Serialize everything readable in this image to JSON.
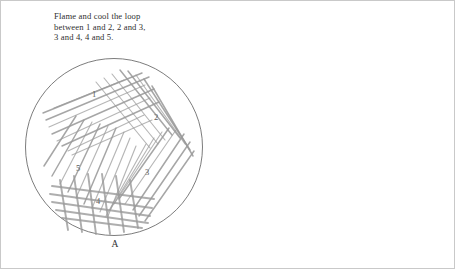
{
  "figure": {
    "background_color": "#ffffff",
    "frame_color": "#c9c9c9",
    "streak_color": "#9a9a9a",
    "rim_color": "#6d6d6d",
    "text_color": "#2f2f2f"
  },
  "panels": [
    {
      "id": "A",
      "label": "A",
      "caption": "Flame and cool the loop\nbetween 1 and 2, 2 and 3,\n3 and 4, 4 and 5.",
      "caption_lines": [
        "Flame and cool the loop",
        "between 1 and 2, 2 and 3,",
        "3 and 4, 4 and 5."
      ],
      "technique": "quadrant-streak",
      "sector_count": 5,
      "sector_labels": [
        "1",
        "2",
        "3",
        "4",
        "5"
      ],
      "sector_positions": [
        {
          "label": "1",
          "x": 68,
          "y": 39
        },
        {
          "label": "2",
          "x": 130,
          "y": 62
        },
        {
          "label": "3",
          "x": 121,
          "y": 117
        },
        {
          "label": "4",
          "x": 72,
          "y": 146
        },
        {
          "label": "5",
          "x": 52,
          "y": 113
        }
      ]
    },
    {
      "id": "B",
      "label": "B",
      "caption": "Flame and cool the loop\nbetween 1 and 2, 2 and 3.",
      "caption_lines": [
        "Flame and cool the loop",
        "between 1 and 2, 2 and 3."
      ],
      "technique": "continuous-streak",
      "sector_count": 3,
      "sector_labels": [
        "1",
        "2",
        "3"
      ],
      "sector_positions": [
        {
          "label": "1",
          "x": 96,
          "y": 59
        },
        {
          "label": "2",
          "x": 124,
          "y": 116
        },
        {
          "label": "3",
          "x": 62,
          "y": 135
        }
      ]
    }
  ],
  "chart_data": {
    "type": "diagram",
    "plates": [
      {
        "name": "A",
        "streak_sections": 5,
        "description": "Quadrant streak plate with five successively flamed streak sections"
      },
      {
        "name": "B",
        "streak_sections": 3,
        "description": "Continuous zig-zag streak plate with three successively flamed streak sections"
      }
    ]
  }
}
